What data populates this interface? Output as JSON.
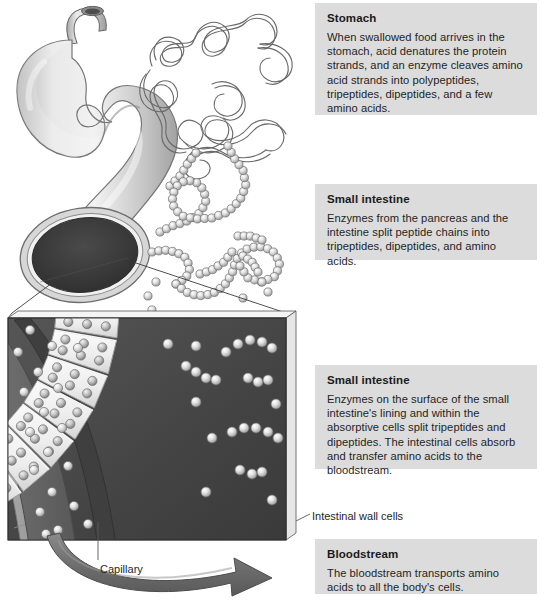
{
  "boxes": {
    "stomach": {
      "title": "Stomach",
      "body": "When swallowed food arrives in the stomach, acid denatures the protein strands, and an enzyme cleaves amino acid strands into polypeptides, tripeptides, dipeptides, and a few amino acids."
    },
    "small_intestine_lumen": {
      "title": "Small intestine",
      "body": "Enzymes from the pancreas and the intestine split peptide chains into tripeptides, dipeptides, and amino acids."
    },
    "small_intestine_wall": {
      "title": "Small intestine",
      "body": "Enzymes on the surface of the small intestine's lining and within the absorptive cells split tripeptides and dipeptides. The intestinal cells absorb and transfer amino acids to the bloodstream."
    },
    "bloodstream": {
      "title": "Bloodstream",
      "body": "The bloodstream transports amino acids to all the body's cells."
    }
  },
  "labels": {
    "capillary": "Capillary",
    "intestinal_wall_cells": "Intestinal wall cells"
  },
  "illustration": {
    "stomach_organ": "stomach-organ",
    "protein_strands": "tangled-protein-strands",
    "peptide_chains": "peptide-chains-spheres",
    "magnified_panel": "magnified-intestinal-wall-panel",
    "absorptive_cells": "absorptive-cell-blocks",
    "capillary_band": "capillary-band",
    "transport_arrow": "amino-acid-transport-arrow"
  },
  "colors": {
    "box_bg": "#dcdcdc",
    "text": "#1f1f1f",
    "organ_light": "#e3e3e3",
    "organ_mid": "#bdbdbd",
    "organ_dark": "#8f8f8f",
    "lumen_dark": "#3a3a3a",
    "panel_dark": "#4a4a4a",
    "capillary_gray": "#6e6e6e",
    "capillary_edge": "#3f3f3f",
    "cell_light": "#f2f2f2",
    "sphere_light": "#e8e8e8",
    "sphere_shade": "#9a9a9a",
    "arrow_gray": "#6f6f6f",
    "leader_line": "#5a5a5a"
  }
}
